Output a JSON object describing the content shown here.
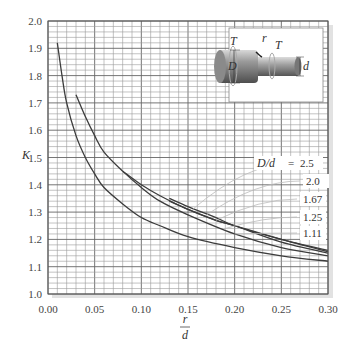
{
  "chart_data": {
    "type": "line",
    "title": "",
    "xlabel": "r/d",
    "xlabel_numerator": "r",
    "xlabel_denominator": "d",
    "ylabel": "K",
    "xlim": [
      0.0,
      0.3
    ],
    "ylim": [
      1.0,
      2.0
    ],
    "grid": true,
    "x_ticks": [
      "0.00",
      "0.05",
      "0.10",
      "0.15",
      "0.20",
      "0.25",
      "0.30"
    ],
    "y_ticks": [
      "1.0",
      "1.1",
      "1.2",
      "1.3",
      "1.4",
      "1.5",
      "1.6",
      "1.7",
      "1.8",
      "1.9",
      "2.0"
    ],
    "legend_title": "D/d =",
    "legend_position": "right, inside plot with leader lines",
    "series": [
      {
        "name": "2.5",
        "label": "D/d = 2.5",
        "x": [
          0.13,
          0.15,
          0.18,
          0.2,
          0.25,
          0.3
        ],
        "y": [
          1.35,
          1.32,
          1.28,
          1.25,
          1.2,
          1.16
        ]
      },
      {
        "name": "2.0",
        "label": "2.0",
        "x": [
          0.13,
          0.15,
          0.18,
          0.2,
          0.25,
          0.3
        ],
        "y": [
          1.34,
          1.31,
          1.27,
          1.25,
          1.2,
          1.155
        ]
      },
      {
        "name": "1.67",
        "label": "1.67",
        "x": [
          0.08,
          0.1,
          0.12,
          0.15,
          0.18,
          0.2,
          0.25,
          0.3
        ],
        "y": [
          1.45,
          1.4,
          1.36,
          1.31,
          1.27,
          1.25,
          1.19,
          1.15
        ]
      },
      {
        "name": "1.25",
        "label": "1.25",
        "x": [
          0.03,
          0.04,
          0.05,
          0.06,
          0.08,
          0.1,
          0.12,
          0.15,
          0.2,
          0.25,
          0.3
        ],
        "y": [
          1.73,
          1.65,
          1.58,
          1.52,
          1.45,
          1.39,
          1.34,
          1.29,
          1.22,
          1.17,
          1.14
        ]
      },
      {
        "name": "1.11",
        "label": "1.11",
        "x": [
          0.01,
          0.015,
          0.02,
          0.03,
          0.04,
          0.05,
          0.06,
          0.08,
          0.1,
          0.12,
          0.15,
          0.2,
          0.25,
          0.3
        ],
        "y": [
          1.92,
          1.8,
          1.7,
          1.58,
          1.5,
          1.44,
          1.39,
          1.33,
          1.28,
          1.25,
          1.21,
          1.17,
          1.14,
          1.12
        ]
      }
    ],
    "inset": {
      "description": "stepped shaft under torque with fillet",
      "labels": [
        "T",
        "r",
        "T",
        "D",
        "d"
      ]
    }
  },
  "labels": {
    "y_axis": "K",
    "x_num": "r",
    "x_den": "d",
    "legend_prefix": "D/d",
    "legend_eq": "=",
    "inset_T1": "T",
    "inset_r": "r",
    "inset_T2": "T",
    "inset_D": "D",
    "inset_d": "d"
  }
}
